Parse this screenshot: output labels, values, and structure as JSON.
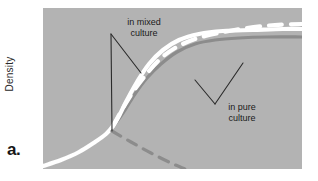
{
  "figure": {
    "panel_label": "a.",
    "y_axis_label": "Density",
    "plot_background": "#b3b3b3",
    "page_background": "#ffffff"
  },
  "annotations": [
    {
      "id": "mixed",
      "text": "in mixed\nculture",
      "color": "#1a1a1a"
    },
    {
      "id": "pure",
      "text": "in pure\nculture",
      "color": "#1a1a1a"
    }
  ],
  "chart_data": {
    "type": "line",
    "title": "",
    "xlabel": "",
    "ylabel": "Density",
    "xlim": [
      0,
      259
    ],
    "ylim": [
      0,
      161
    ],
    "grid": false,
    "legend": "none",
    "axis_ticks": false,
    "series": [
      {
        "name": "in pure culture",
        "style": "solid",
        "color": "#8c8c8c",
        "width": 3.2,
        "description": "gray sigmoid growth curve rising to a lower plateau",
        "points": [
          [
            0,
            158
          ],
          [
            18,
            152
          ],
          [
            36,
            144
          ],
          [
            52,
            134
          ],
          [
            63,
            126
          ],
          [
            72,
            116
          ],
          [
            82,
            102
          ],
          [
            92,
            86
          ],
          [
            104,
            70
          ],
          [
            118,
            56
          ],
          [
            134,
            44
          ],
          [
            152,
            36
          ],
          [
            172,
            32
          ],
          [
            196,
            30
          ],
          [
            224,
            29
          ],
          [
            259,
            29
          ]
        ]
      },
      {
        "name": "in mixed culture",
        "style": "solid",
        "color": "#ffffff",
        "width": 4.2,
        "description": "white sigmoid growth curve rising to a higher plateau than pure culture",
        "points": [
          [
            0,
            158
          ],
          [
            18,
            152
          ],
          [
            36,
            144
          ],
          [
            52,
            134
          ],
          [
            63,
            126
          ],
          [
            70,
            118
          ],
          [
            76,
            108
          ],
          [
            84,
            92
          ],
          [
            94,
            74
          ],
          [
            106,
            56
          ],
          [
            120,
            42
          ],
          [
            136,
            32
          ],
          [
            156,
            26
          ],
          [
            180,
            23
          ],
          [
            210,
            22
          ],
          [
            240,
            21
          ],
          [
            259,
            21
          ]
        ]
      },
      {
        "name": "in mixed culture (dashed upper)",
        "style": "dashed",
        "color": "#ffffff",
        "width": 4.2,
        "dash": "13,9",
        "description": "white dashed curve branching upward to the highest plateau",
        "points": [
          [
            70,
            118
          ],
          [
            80,
            100
          ],
          [
            90,
            84
          ],
          [
            102,
            68
          ],
          [
            116,
            52
          ],
          [
            132,
            40
          ],
          [
            152,
            31
          ],
          [
            176,
            25
          ],
          [
            204,
            20
          ],
          [
            232,
            17
          ],
          [
            259,
            16
          ]
        ]
      },
      {
        "name": "in pure culture (dashed decline)",
        "style": "dashed",
        "color": "#8c8c8c",
        "width": 3.2,
        "dash": "10,8",
        "description": "gray dashed branch descending to the bottom right from the branch point",
        "points": [
          [
            69,
            123
          ],
          [
            88,
            134
          ],
          [
            108,
            145
          ],
          [
            128,
            155
          ],
          [
            142,
            161
          ]
        ]
      }
    ],
    "leaders": [
      {
        "name": "mixed-leader-vertical",
        "color": "#2b2b2b",
        "width": 1.1,
        "points": [
          [
            68,
            26
          ],
          [
            69,
            123
          ]
        ]
      },
      {
        "name": "mixed-leader-diagonal",
        "color": "#2b2b2b",
        "width": 1.1,
        "points": [
          [
            68,
            26
          ],
          [
            98,
            65
          ]
        ]
      },
      {
        "name": "pure-leader-to-white",
        "color": "#2b2b2b",
        "width": 1.1,
        "points": [
          [
            172,
            96
          ],
          [
            200,
            55
          ]
        ]
      },
      {
        "name": "pure-leader-to-gray",
        "color": "#2b2b2b",
        "width": 1.1,
        "points": [
          [
            172,
            96
          ],
          [
            152,
            72
          ]
        ]
      }
    ]
  }
}
